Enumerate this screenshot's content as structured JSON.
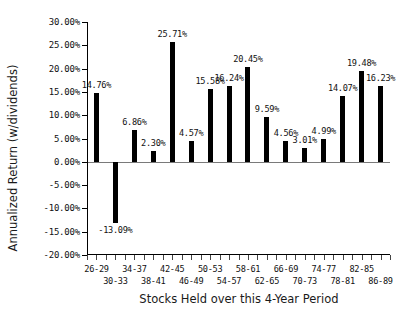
{
  "chart_data": {
    "type": "bar",
    "title": "",
    "xlabel": "Stocks Held over this 4-Year Period",
    "ylabel": "Annualized Return (w/dividends)",
    "categories": [
      "26-29",
      "30-33",
      "34-37",
      "38-41",
      "42-45",
      "46-49",
      "50-53",
      "54-57",
      "58-61",
      "62-65",
      "66-69",
      "70-73",
      "74-77",
      "78-81",
      "82-85",
      "86-89"
    ],
    "values": [
      14.76,
      -13.09,
      6.86,
      2.3,
      25.71,
      4.57,
      15.58,
      16.24,
      20.45,
      9.59,
      4.56,
      3.01,
      4.99,
      14.07,
      19.48,
      16.23
    ],
    "value_labels": [
      "14.76%",
      "-13.09%",
      "6.86%",
      "2.30%",
      "25.71%",
      "4.57%",
      "15.58%",
      "16.24%",
      "20.45%",
      "9.59%",
      "4.56%",
      "3.01%",
      "4.99%",
      "14.07%",
      "19.48%",
      "16.23%"
    ],
    "ylim": [
      -20,
      30
    ],
    "ytick_values": [
      30,
      25,
      20,
      15,
      10,
      5,
      0,
      -5,
      -10,
      -15,
      -20
    ],
    "ytick_labels": [
      "30.00%",
      "25.00%",
      "20.00%",
      "15.00%",
      "10.00%",
      "5.00%",
      "0.00%",
      "-5.00%",
      "-10.00%",
      "-15.00%",
      "-20.00%"
    ],
    "grid": false,
    "legend": "none",
    "bar_color": "#000000",
    "background_color": "#ffffff"
  }
}
